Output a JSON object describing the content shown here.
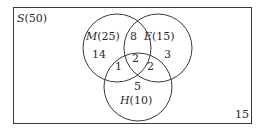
{
  "universe": {
    "label": "S",
    "count": "(50)",
    "outside_value": "15"
  },
  "sets": [
    {
      "name": "M",
      "count": "(25)",
      "only": "14"
    },
    {
      "name": "E",
      "count": "(15)",
      "only": "3"
    },
    {
      "name": "H",
      "count": "(10)",
      "only": "5"
    }
  ],
  "intersections": {
    "M_E": "8",
    "M_H": "1",
    "E_H": "2",
    "M_E_H": "2"
  },
  "colors": {
    "stroke": "#3a3a3a",
    "text": "#2a2a2a",
    "background": "#ffffff"
  }
}
